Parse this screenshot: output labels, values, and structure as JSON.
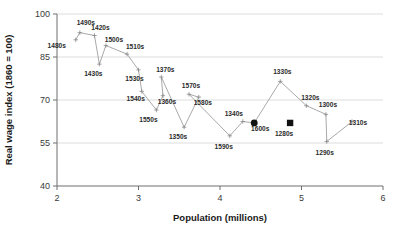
{
  "chart_data": {
    "type": "line",
    "title": "",
    "xlabel": "Population (millions)",
    "ylabel": "Real wage index (1860 = 100)",
    "xlim": [
      2,
      6
    ],
    "ylim": [
      40,
      100
    ],
    "xticks": [
      2,
      3,
      4,
      5,
      6
    ],
    "yticks": [
      40,
      55,
      70,
      85,
      100
    ],
    "grid": true,
    "legend": false,
    "series": [
      {
        "name": "Real wage vs population (decades, 1280s-1600s)",
        "points": [
          {
            "decade": "1490s",
            "x": 2.28,
            "y": 93.5,
            "label_dx": 6,
            "label_dy": -8,
            "marker": "open"
          },
          {
            "decade": "1480s",
            "x": 2.23,
            "y": 91.0,
            "label_dx": -19,
            "label_dy": 8,
            "marker": "open"
          },
          {
            "decade": "1420s",
            "x": 2.46,
            "y": 92.5,
            "label_dx": 6,
            "label_dy": -6,
            "marker": "open"
          },
          {
            "decade": "1500s",
            "x": 2.6,
            "y": 89.0,
            "label_dx": 8,
            "label_dy": -4,
            "marker": "open"
          },
          {
            "decade": "1430s",
            "x": 2.52,
            "y": 82.5,
            "label_dx": -6,
            "label_dy": 12,
            "marker": "open"
          },
          {
            "decade": "1510s",
            "x": 2.86,
            "y": 86.0,
            "label_dx": 8,
            "label_dy": -5,
            "marker": "open"
          },
          {
            "decade": "1530s",
            "x": 3.0,
            "y": 80.5,
            "label_dx": -4,
            "label_dy": 11,
            "marker": "open"
          },
          {
            "decade": "1540s",
            "x": 3.04,
            "y": 73.0,
            "label_dx": -6,
            "label_dy": 10,
            "marker": "open"
          },
          {
            "decade": "1370s",
            "x": 3.28,
            "y": 78.0,
            "label_dx": 4,
            "label_dy": -5,
            "marker": "open"
          },
          {
            "decade": "1360s",
            "x": 3.3,
            "y": 71.5,
            "label_dx": 4,
            "label_dy": 8,
            "marker": "open"
          },
          {
            "decade": "1550s",
            "x": 3.22,
            "y": 66.5,
            "label_dx": -8,
            "label_dy": 12,
            "marker": "open"
          },
          {
            "decade": "1570s",
            "x": 3.62,
            "y": 72.0,
            "label_dx": 2,
            "label_dy": -6,
            "marker": "open"
          },
          {
            "decade": "1580s",
            "x": 3.74,
            "y": 71.0,
            "label_dx": 4,
            "label_dy": 8,
            "marker": "open"
          },
          {
            "decade": "1350s",
            "x": 3.56,
            "y": 60.5,
            "label_dx": -6,
            "label_dy": 12,
            "marker": "open"
          },
          {
            "decade": "1590s",
            "x": 4.12,
            "y": 57.5,
            "label_dx": -6,
            "label_dy": 13,
            "marker": "open"
          },
          {
            "decade": "1340s",
            "x": 4.28,
            "y": 62.5,
            "label_dx": -9,
            "label_dy": -6,
            "marker": "open"
          },
          {
            "decade": "1600s",
            "x": 4.42,
            "y": 62.0,
            "label_dx": 6,
            "label_dy": 8,
            "marker": "filled-circle"
          },
          {
            "decade": "1330s",
            "x": 4.74,
            "y": 76.5,
            "label_dx": 2,
            "label_dy": -7,
            "marker": "open"
          },
          {
            "decade": "1280s",
            "x": 4.86,
            "y": 62.0,
            "label_dx": -6,
            "label_dy": 13,
            "marker": "filled-square"
          },
          {
            "decade": "1320s",
            "x": 5.06,
            "y": 68.0,
            "label_dx": 4,
            "label_dy": -6,
            "marker": "open"
          },
          {
            "decade": "1300s",
            "x": 5.3,
            "y": 65.0,
            "label_dx": 2,
            "label_dy": -7,
            "marker": "open"
          },
          {
            "decade": "1290s",
            "x": 5.31,
            "y": 55.5,
            "label_dx": -2,
            "label_dy": 13,
            "marker": "open"
          },
          {
            "decade": "1310s",
            "x": 5.62,
            "y": 62.5,
            "label_dx": 6,
            "label_dy": 3,
            "marker": "open"
          }
        ],
        "path_order": [
          "1480s",
          "1490s",
          "1420s",
          "1430s",
          "1500s",
          "1510s",
          "1530s",
          "1540s",
          "1550s",
          "1360s",
          "1370s",
          "1350s",
          "1580s",
          "1570s",
          "1590s",
          "1340s",
          "1600s",
          "1330s",
          "1320s",
          "1300s",
          "1290s",
          "1310s"
        ]
      }
    ]
  }
}
